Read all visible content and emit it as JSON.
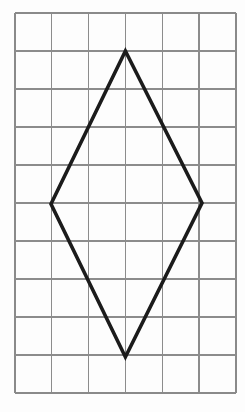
{
  "figure": {
    "type": "geometry-diagram",
    "background_color": "#fdfdfd",
    "canvas": {
      "width": 245,
      "height": 412
    },
    "grid": {
      "columns": 6,
      "rows": 10,
      "origin_x": 15,
      "origin_y": 13,
      "cell_width": 36.8,
      "cell_height": 38.0,
      "line_color": "#8c8c8c",
      "border_color": "#8a8a8a",
      "line_width": 1.1,
      "visible": true,
      "x_lines": [
        15,
        51.8,
        88.6,
        125.4,
        162.2,
        199.0,
        235.8
      ],
      "y_lines": [
        13,
        51,
        89,
        127,
        165,
        203,
        241,
        279,
        317,
        355,
        393
      ]
    },
    "shape": {
      "name": "rhombus",
      "label": "rhombus",
      "stroke_color": "#1b1b1b",
      "stroke_width": 3.6,
      "fill": "none",
      "closed": true,
      "vertices": [
        {
          "name": "top-vertex",
          "grid_col": 3,
          "grid_row": 1,
          "x": 125.4,
          "y": 51
        },
        {
          "name": "right-vertex",
          "grid_col": 5,
          "grid_row": 5,
          "x": 202.0,
          "y": 203
        },
        {
          "name": "bottom-vertex",
          "grid_col": 3,
          "grid_row": 9,
          "x": 125.4,
          "y": 357
        },
        {
          "name": "left-vertex",
          "grid_col": 1,
          "grid_row": 5,
          "x": 51.0,
          "y": 204
        }
      ],
      "diagonals": {
        "horizontal_cells": 4,
        "vertical_cells": 8
      },
      "path_d": "M 125.4 51 L 202.0 203 L 125.4 357 L 51.0 204 Z"
    }
  }
}
